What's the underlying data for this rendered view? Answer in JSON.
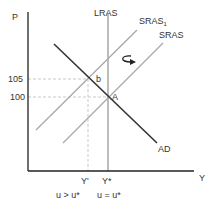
{
  "diagram": {
    "type": "AD-AS model",
    "axes": {
      "y_label": "P",
      "x_label": "Y"
    },
    "curves": {
      "lras": "LRAS",
      "sras1_base": "SRAS",
      "sras1_sub": "1",
      "sras": "SRAS",
      "ad": "AD"
    },
    "price_ticks": {
      "high": "105",
      "low": "100"
    },
    "points": {
      "b": "b",
      "a": "A"
    },
    "output_ticks": {
      "y_prime": "Y'",
      "y_star": "Y*"
    },
    "unemployment": {
      "left": "u > u*",
      "right": "u = u*"
    },
    "arrow": "shift-arrow-icon",
    "colors": {
      "axis": "#222222",
      "ad": "#333333",
      "lras": "#999999",
      "sras": "#a8a8a8",
      "dashed": "#bbbbbb",
      "text": "#333333"
    }
  }
}
